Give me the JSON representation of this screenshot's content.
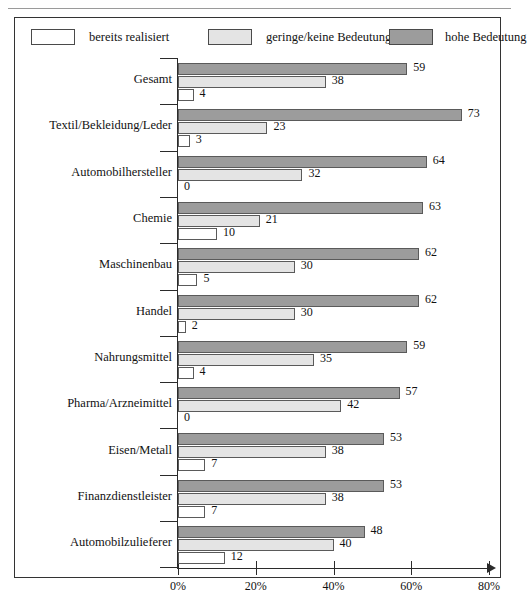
{
  "legend": {
    "items": [
      {
        "key": "realisiert",
        "label": "bereits realisiert",
        "color": "#ffffff"
      },
      {
        "key": "gering",
        "label": "geringe/keine Bedeutung",
        "color": "#e4e4e4"
      },
      {
        "key": "hohe",
        "label": "hohe Bedeutung",
        "color": "#9c9c9c"
      }
    ]
  },
  "axis": {
    "ticks": [
      "0%",
      "20%",
      "40%",
      "60%",
      "80%"
    ],
    "tick_values": [
      0,
      20,
      40,
      60,
      80
    ]
  },
  "chart_data": {
    "type": "bar",
    "title": "",
    "subtitle": "",
    "xlabel": "",
    "ylabel": "",
    "orientation": "horizontal",
    "xlim": [
      0,
      80
    ],
    "grid": false,
    "legend_position": "top",
    "categories": [
      "Gesamt",
      "Textil/Bekleidung/Leder",
      "Automobilhersteller",
      "Chemie",
      "Maschinenbau",
      "Handel",
      "Nahrungsmittel",
      "Pharma/Arzneimittel",
      "Eisen/Metall",
      "Finanzdienstleister",
      "Automobilzulieferer"
    ],
    "series": [
      {
        "name": "hohe Bedeutung",
        "color": "#9c9c9c",
        "values": [
          59,
          73,
          64,
          63,
          62,
          62,
          59,
          57,
          53,
          53,
          48
        ]
      },
      {
        "name": "geringe/keine Bedeutung",
        "color": "#e4e4e4",
        "values": [
          38,
          23,
          32,
          21,
          30,
          30,
          35,
          42,
          38,
          38,
          40
        ]
      },
      {
        "name": "bereits realisiert",
        "color": "#ffffff",
        "values": [
          4,
          3,
          0,
          10,
          5,
          2,
          4,
          0,
          7,
          7,
          12
        ]
      }
    ]
  }
}
